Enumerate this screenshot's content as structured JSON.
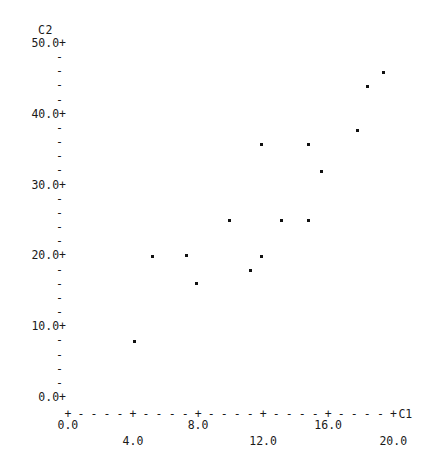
{
  "chart_data": {
    "type": "scatter",
    "title": "",
    "xlabel": "C1",
    "ylabel": "C2",
    "xlim": [
      0.0,
      21.5
    ],
    "ylim": [
      0.0,
      50.0
    ],
    "xticks": [
      "0.0",
      "4.0",
      "8.0",
      "12.0",
      "16.0",
      "20.0"
    ],
    "xtick_values": [
      0.0,
      4.0,
      8.0,
      12.0,
      16.0,
      20.0
    ],
    "yticks": [
      "0.0+",
      "10.0+",
      "20.0+",
      "30.0+",
      "40.0+",
      "50.0+"
    ],
    "ytick_values": [
      0.0,
      10.0,
      20.0,
      30.0,
      40.0,
      50.0
    ],
    "grid": false,
    "legend": null,
    "minor_tick_glyph": "-",
    "major_tick_glyph": "+",
    "axis_dash_glyph": "-",
    "points": [
      {
        "x": 4.1,
        "y": 7.9
      },
      {
        "x": 5.2,
        "y": 19.9
      },
      {
        "x": 7.3,
        "y": 20.0
      },
      {
        "x": 7.9,
        "y": 16.1
      },
      {
        "x": 9.9,
        "y": 25.0
      },
      {
        "x": 11.2,
        "y": 17.9
      },
      {
        "x": 11.9,
        "y": 19.9
      },
      {
        "x": 11.9,
        "y": 35.6
      },
      {
        "x": 13.1,
        "y": 25.0
      },
      {
        "x": 14.8,
        "y": 35.6
      },
      {
        "x": 14.8,
        "y": 25.0
      },
      {
        "x": 15.6,
        "y": 31.8
      },
      {
        "x": 17.8,
        "y": 37.7
      },
      {
        "x": 18.4,
        "y": 43.8
      },
      {
        "x": 19.4,
        "y": 45.8
      }
    ]
  },
  "axis": {
    "y_title": "C2",
    "x_title": "C1"
  }
}
